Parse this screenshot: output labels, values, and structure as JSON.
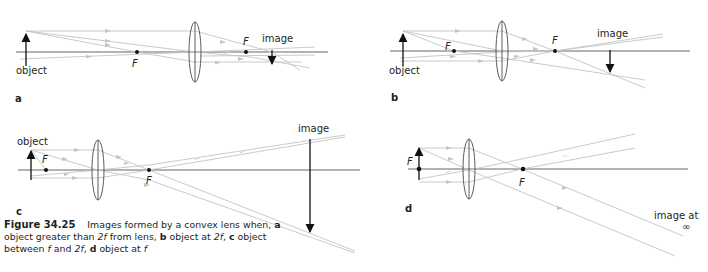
{
  "figure": {
    "number": "Figure 34.25",
    "caption_parts": [
      {
        "text": "Images formed by a convex lens when, "
      },
      {
        "text": "a",
        "style": "bold"
      },
      {
        "text": " object greater than "
      },
      {
        "text": "2f",
        "style": "italic"
      },
      {
        "text": " from lens, "
      },
      {
        "text": "b",
        "style": "bold"
      },
      {
        "text": " object at "
      },
      {
        "text": "2f",
        "style": "italic"
      },
      {
        "text": ",  "
      },
      {
        "text": "c",
        "style": "bold"
      },
      {
        "text": " object between "
      },
      {
        "text": "f",
        "style": "italic"
      },
      {
        "text": " and "
      },
      {
        "text": "2f",
        "style": "italic"
      },
      {
        "text": ", "
      },
      {
        "text": "d",
        "style": "bold"
      },
      {
        "text": " object at "
      },
      {
        "text": "f",
        "style": "italic"
      }
    ]
  },
  "panels": {
    "a": {
      "label": "a",
      "object_label": "object",
      "image_label": "image",
      "focal_left": "F",
      "focal_right": "F"
    },
    "b": {
      "label": "b",
      "object_label": "object",
      "image_label": "image",
      "focal_left": "F",
      "focal_right": "F"
    },
    "c": {
      "label": "c",
      "object_label": "object",
      "image_label": "image",
      "focal_left": "F",
      "focal_right": "F"
    },
    "d": {
      "label": "d",
      "object_label": "F",
      "image_label": "image at",
      "image_label_2": "∞",
      "focal_right": "F"
    }
  },
  "colors": {
    "ray": "#c4c4c4",
    "axis": "#555555",
    "ink": "#231f20"
  }
}
